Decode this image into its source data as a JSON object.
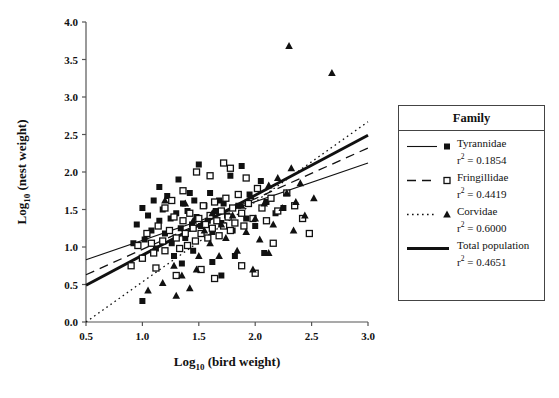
{
  "chart_data": {
    "type": "scatter",
    "title": "",
    "xlabel": "Log10 (bird weight)",
    "ylabel": "Log10 (nest weight)",
    "xlim": [
      0.5,
      3.0
    ],
    "ylim": [
      0.0,
      4.0
    ],
    "xticks": [
      "0.5",
      "1.0",
      "1.5",
      "2.0",
      "2.5",
      "3.0"
    ],
    "yticks": [
      "0.0",
      "0.5",
      "1.0",
      "1.5",
      "2.0",
      "2.5",
      "3.0",
      "3.5",
      "4.0"
    ],
    "grid": false,
    "legend_position": "right-outside",
    "legend_title": "Family",
    "series": [
      {
        "name": "Tyrannidae",
        "marker": "filled-square",
        "line_style": "solid-thin",
        "r2_label": "r2 = 0.1854",
        "r2": 0.1854,
        "fit_line": {
          "x": [
            0.5,
            3.0
          ],
          "y": [
            0.83,
            2.12
          ]
        },
        "points": [
          [
            0.95,
            1.3
          ],
          [
            1.0,
            1.52
          ],
          [
            1.02,
            1.1
          ],
          [
            1.05,
            1.42
          ],
          [
            1.08,
            1.22
          ],
          [
            1.1,
            1.62
          ],
          [
            1.12,
            0.98
          ],
          [
            1.15,
            1.35
          ],
          [
            1.18,
            1.5
          ],
          [
            1.2,
            1.18
          ],
          [
            1.22,
            1.68
          ],
          [
            1.25,
            1.38
          ],
          [
            1.26,
            1.05
          ],
          [
            1.3,
            1.45
          ],
          [
            1.32,
            1.9
          ],
          [
            1.34,
            1.25
          ],
          [
            1.36,
            1.58
          ],
          [
            1.38,
            1.12
          ],
          [
            1.4,
            1.48
          ],
          [
            1.42,
            1.72
          ],
          [
            1.44,
            1.3
          ],
          [
            1.46,
            1.62
          ],
          [
            1.48,
            1.4
          ],
          [
            1.5,
            2.1
          ],
          [
            1.52,
            1.28
          ],
          [
            1.55,
            1.55
          ],
          [
            1.58,
            1.35
          ],
          [
            1.6,
            1.72
          ],
          [
            1.62,
            1.2
          ],
          [
            1.65,
            1.48
          ],
          [
            1.68,
            1.62
          ],
          [
            1.7,
            1.32
          ],
          [
            1.72,
            1.58
          ],
          [
            1.75,
            1.42
          ],
          [
            1.78,
            1.95
          ],
          [
            1.8,
            1.22
          ],
          [
            1.85,
            1.55
          ],
          [
            1.88,
            2.08
          ],
          [
            1.92,
            1.38
          ],
          [
            1.95,
            1.7
          ],
          [
            2.0,
            1.28
          ],
          [
            2.05,
            1.88
          ],
          [
            2.1,
            1.6
          ],
          [
            2.18,
            1.45
          ],
          [
            2.25,
            1.52
          ],
          [
            1.0,
            0.28
          ],
          [
            1.28,
            0.88
          ],
          [
            1.45,
            0.95
          ],
          [
            1.62,
            0.8
          ],
          [
            1.7,
            0.62
          ],
          [
            1.82,
            0.88
          ],
          [
            2.08,
            0.92
          ],
          [
            0.92,
            1.05
          ],
          [
            1.15,
            1.8
          ],
          [
            1.35,
            0.78
          ]
        ]
      },
      {
        "name": "Fringillidae",
        "marker": "open-square",
        "line_style": "dashed",
        "r2_label": "r2 = 0.4419",
        "r2": 0.4419,
        "fit_line": {
          "x": [
            0.5,
            3.0
          ],
          "y": [
            0.63,
            2.32
          ]
        },
        "points": [
          [
            0.96,
            1.02
          ],
          [
            1.0,
            0.85
          ],
          [
            1.04,
            1.18
          ],
          [
            1.08,
            1.05
          ],
          [
            1.1,
            0.92
          ],
          [
            1.14,
            1.28
          ],
          [
            1.18,
            1.08
          ],
          [
            1.2,
            0.95
          ],
          [
            1.24,
            1.22
          ],
          [
            1.28,
            1.4
          ],
          [
            1.3,
            1.12
          ],
          [
            1.33,
            0.98
          ],
          [
            1.36,
            1.35
          ],
          [
            1.38,
            1.18
          ],
          [
            1.4,
            1.02
          ],
          [
            1.42,
            1.45
          ],
          [
            1.45,
            1.25
          ],
          [
            1.47,
            1.08
          ],
          [
            1.5,
            1.38
          ],
          [
            1.52,
            1.18
          ],
          [
            1.54,
            1.55
          ],
          [
            1.56,
            1.3
          ],
          [
            1.58,
            1.12
          ],
          [
            1.6,
            1.42
          ],
          [
            1.62,
            1.25
          ],
          [
            1.64,
            1.6
          ],
          [
            1.66,
            1.35
          ],
          [
            1.68,
            1.15
          ],
          [
            1.7,
            1.48
          ],
          [
            1.72,
            1.28
          ],
          [
            1.74,
            1.65
          ],
          [
            1.76,
            1.4
          ],
          [
            1.78,
            1.22
          ],
          [
            1.8,
            1.52
          ],
          [
            1.82,
            1.32
          ],
          [
            1.85,
            1.7
          ],
          [
            1.88,
            1.45
          ],
          [
            1.9,
            1.28
          ],
          [
            1.94,
            1.58
          ],
          [
            1.98,
            1.38
          ],
          [
            2.02,
            1.78
          ],
          [
            2.06,
            1.52
          ],
          [
            2.1,
            1.35
          ],
          [
            2.14,
            1.65
          ],
          [
            2.2,
            1.48
          ],
          [
            2.28,
            1.72
          ],
          [
            2.35,
            1.55
          ],
          [
            1.72,
            2.12
          ],
          [
            1.78,
            2.05
          ],
          [
            1.92,
            1.92
          ],
          [
            1.6,
            1.95
          ],
          [
            1.48,
            2.0
          ],
          [
            1.36,
            1.75
          ],
          [
            1.26,
            1.62
          ],
          [
            1.2,
            1.52
          ],
          [
            2.42,
            1.38
          ],
          [
            2.48,
            1.18
          ],
          [
            1.12,
            0.72
          ],
          [
            1.3,
            0.62
          ],
          [
            1.52,
            0.7
          ],
          [
            1.64,
            0.58
          ],
          [
            1.88,
            0.75
          ],
          [
            2.0,
            0.65
          ],
          [
            2.16,
            1.05
          ],
          [
            0.9,
            0.75
          ]
        ]
      },
      {
        "name": "Corvidae",
        "marker": "filled-triangle",
        "line_style": "dotted",
        "r2_label": "r2 = 0.6000",
        "r2": 0.6,
        "fit_line": {
          "x": [
            0.5,
            3.0
          ],
          "y": [
            0.0,
            2.67
          ]
        },
        "points": [
          [
            1.05,
            0.42
          ],
          [
            1.18,
            0.52
          ],
          [
            1.3,
            0.35
          ],
          [
            1.35,
            0.62
          ],
          [
            1.42,
            0.45
          ],
          [
            1.48,
            0.7
          ],
          [
            1.2,
            1.62
          ],
          [
            1.38,
            1.58
          ],
          [
            1.55,
            1.22
          ],
          [
            1.6,
            1.05
          ],
          [
            1.62,
            1.45
          ],
          [
            1.68,
            0.88
          ],
          [
            1.7,
            1.3
          ],
          [
            1.74,
            1.12
          ],
          [
            1.8,
            1.42
          ],
          [
            1.84,
            0.95
          ],
          [
            1.88,
            1.55
          ],
          [
            1.92,
            1.2
          ],
          [
            1.96,
            1.68
          ],
          [
            2.0,
            1.38
          ],
          [
            2.04,
            1.1
          ],
          [
            2.08,
            1.58
          ],
          [
            2.12,
            1.82
          ],
          [
            2.16,
            1.3
          ],
          [
            2.2,
            1.92
          ],
          [
            2.24,
            1.52
          ],
          [
            2.28,
            1.72
          ],
          [
            2.32,
            2.05
          ],
          [
            2.36,
            1.6
          ],
          [
            2.4,
            1.85
          ],
          [
            2.44,
            1.42
          ],
          [
            2.52,
            1.65
          ],
          [
            2.3,
            3.68
          ],
          [
            2.68,
            3.32
          ],
          [
            1.5,
            0.88
          ],
          [
            1.28,
            0.75
          ],
          [
            2.12,
            0.92
          ],
          [
            1.98,
            0.7
          ],
          [
            2.34,
            1.22
          ],
          [
            1.45,
            1.35
          ]
        ]
      },
      {
        "name": "Total population",
        "marker": "none",
        "line_style": "solid-thick",
        "r2_label": "r2 = 0.4651",
        "r2": 0.4651,
        "fit_line": {
          "x": [
            0.5,
            3.0
          ],
          "y": [
            0.49,
            2.49
          ]
        },
        "points": []
      }
    ]
  },
  "legend": {
    "title": "Family",
    "entries": [
      {
        "label": "Tyrannidae",
        "r2": "r2 = 0.1854"
      },
      {
        "label": "Fringillidae",
        "r2": "r2 = 0.4419"
      },
      {
        "label": "Corvidae",
        "r2": "r2 = 0.6000"
      },
      {
        "label": "Total population",
        "r2": "r2 = 0.4651"
      }
    ]
  },
  "axes": {
    "x_title_main": "Log",
    "x_title_sub": "10",
    "x_title_rest": " (bird weight)",
    "y_title_main": "Log",
    "y_title_sub": "10",
    "y_title_rest": " (nest weight)"
  },
  "colors": {
    "ink": "#111111",
    "axis": "#555555",
    "legend_border": "#444444",
    "background": "#ffffff"
  }
}
